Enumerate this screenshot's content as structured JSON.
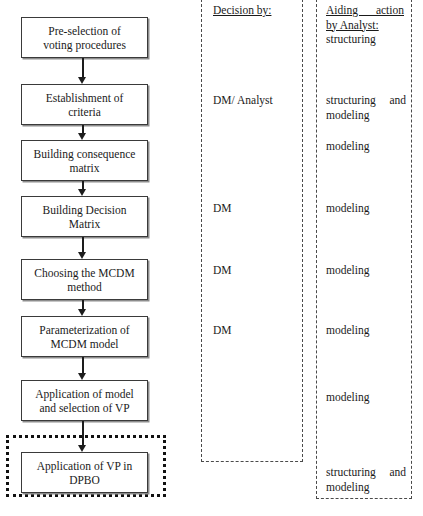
{
  "diagram": {
    "title_present": false,
    "flow": {
      "nodes": [
        {
          "id": "pre-selection",
          "label": "Pre-selection of\nvoting procedures"
        },
        {
          "id": "establishment",
          "label": "Establishment of\ncriteria"
        },
        {
          "id": "consequence-matrix",
          "label": "Building consequence\nmatrix"
        },
        {
          "id": "decision-matrix",
          "label": "Building Decision\nMatrix"
        },
        {
          "id": "choosing-method",
          "label": "Choosing the MCDM\nmethod"
        },
        {
          "id": "parameterization",
          "label": "Parameterization of\nMCDM model"
        },
        {
          "id": "application-model",
          "label": "Application of model\nand selection of VP"
        },
        {
          "id": "application-dpbo",
          "label": "Application of VP in\nDPBO"
        }
      ]
    },
    "decision_column": {
      "header": "Decision by:",
      "entries": [
        {
          "text": "DM/ Analyst"
        },
        {
          "text": "DM"
        },
        {
          "text": "DM"
        },
        {
          "text": "DM"
        }
      ]
    },
    "aiding_column": {
      "header_line1": "Aiding action",
      "header_line2": "by Analyst:",
      "entries": [
        {
          "text": "structuring"
        },
        {
          "line1": "structuring and",
          "line2": "modeling"
        },
        {
          "text": "modeling"
        },
        {
          "text": "modeling"
        },
        {
          "text": "modeling"
        },
        {
          "text": "modeling"
        },
        {
          "text": "modeling"
        },
        {
          "line1": "structuring and",
          "line2": "modeling"
        }
      ]
    },
    "colors": {
      "box_border": "#3a3a3a",
      "box_shadow": "#8d8d8d",
      "arrow": "#1d1d1d",
      "dashed_border": "#4a4a4a",
      "dotted_highlight": "#111111",
      "text": "#1a1a1a",
      "background": "#ffffff"
    }
  }
}
